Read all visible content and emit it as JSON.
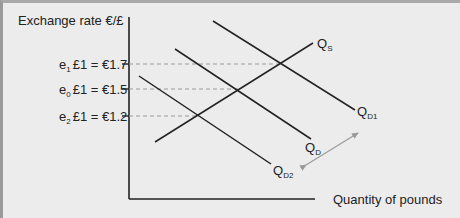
{
  "diagram": {
    "y_axis_label": "Exchange rate €/£",
    "x_axis_label": "Quantity of pounds",
    "rates": [
      {
        "name": "e",
        "sub": "1",
        "text": "£1 = €1.7",
        "value": 1.7
      },
      {
        "name": "e",
        "sub": "0",
        "text": "£1 = €1.5",
        "value": 1.5
      },
      {
        "name": "e",
        "sub": "2",
        "text": "£1 = €1.2",
        "value": 1.2
      }
    ],
    "curves": [
      {
        "id": "supply",
        "label": "Q",
        "sub": "S"
      },
      {
        "id": "demand1",
        "label": "Q",
        "sub": "D1"
      },
      {
        "id": "demand",
        "label": "Q",
        "sub": "D"
      },
      {
        "id": "demand2",
        "label": "Q",
        "sub": "D2"
      }
    ],
    "shift_arrow": "double-headed arrow indicating demand shift",
    "colors": {
      "background": "#ececec",
      "line": "#222222",
      "dashed": "#9a9a9a",
      "arrow": "#9a9a9a"
    }
  }
}
